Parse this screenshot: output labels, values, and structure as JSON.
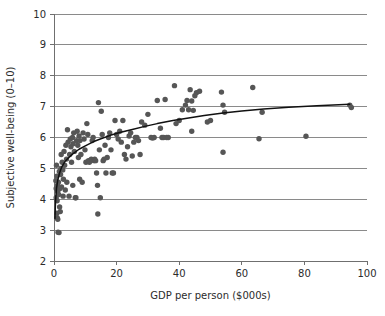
{
  "chart_data": {
    "type": "scatter",
    "title": "",
    "xlabel": "GDP per person ($000s)",
    "ylabel": "Subjective well-being (0–10)",
    "xlim": [
      0,
      100
    ],
    "ylim": [
      2,
      10
    ],
    "xticks": [
      0,
      20,
      40,
      60,
      80,
      100
    ],
    "xtick_labels": [
      "0",
      "20",
      "40",
      "60",
      "80",
      "100"
    ],
    "yticks": [
      2,
      3,
      4,
      5,
      6,
      7,
      8,
      9,
      10
    ],
    "ytick_labels": [
      "2",
      "3",
      "4",
      "5",
      "6",
      "7",
      "8",
      "9",
      "10"
    ],
    "grid": "horizontal",
    "legend": "none",
    "point_color": "#565656",
    "curve_color": "#111111",
    "gridline_color": "#8a8a8a",
    "background_color": "#ffffff",
    "series": [
      {
        "name": "Countries",
        "marker": "circle",
        "points": [
          [
            0.6,
            4.6
          ],
          [
            0.7,
            4.35
          ],
          [
            0.8,
            5.1
          ],
          [
            0.9,
            4.75
          ],
          [
            0.7,
            4.05
          ],
          [
            1.0,
            3.95
          ],
          [
            1.1,
            4.45
          ],
          [
            1.2,
            4.25
          ],
          [
            0.9,
            3.55
          ],
          [
            1.0,
            3.4
          ],
          [
            1.3,
            2.93
          ],
          [
            1.6,
            2.92
          ],
          [
            1.2,
            3.35
          ],
          [
            1.5,
            4.15
          ],
          [
            1.4,
            4.55
          ],
          [
            1.7,
            4.9
          ],
          [
            1.9,
            4.35
          ],
          [
            2.1,
            4.8
          ],
          [
            2.2,
            5.0
          ],
          [
            1.8,
            3.75
          ],
          [
            2.0,
            3.6
          ],
          [
            2.4,
            4.4
          ],
          [
            2.6,
            5.2
          ],
          [
            2.3,
            5.45
          ],
          [
            2.8,
            4.95
          ],
          [
            3.0,
            4.65
          ],
          [
            3.2,
            5.55
          ],
          [
            3.4,
            5.1
          ],
          [
            2.9,
            4.1
          ],
          [
            3.6,
            4.3
          ],
          [
            3.8,
            5.75
          ],
          [
            4.0,
            5.3
          ],
          [
            4.3,
            6.25
          ],
          [
            4.5,
            5.85
          ],
          [
            4.1,
            4.55
          ],
          [
            4.8,
            4.1
          ],
          [
            5.0,
            5.45
          ],
          [
            5.2,
            5.95
          ],
          [
            5.4,
            5.7
          ],
          [
            5.6,
            5.2
          ],
          [
            5.9,
            6.0
          ],
          [
            6.1,
            5.8
          ],
          [
            6.3,
            6.15
          ],
          [
            6.5,
            5.55
          ],
          [
            6.0,
            4.45
          ],
          [
            6.8,
            4.05
          ],
          [
            7.0,
            4.05
          ],
          [
            7.2,
            5.9
          ],
          [
            7.4,
            6.2
          ],
          [
            7.6,
            5.75
          ],
          [
            7.8,
            5.35
          ],
          [
            8.0,
            6.05
          ],
          [
            8.3,
            5.9
          ],
          [
            8.6,
            5.45
          ],
          [
            8.2,
            4.65
          ],
          [
            9.0,
            4.55
          ],
          [
            9.3,
            6.15
          ],
          [
            9.6,
            5.95
          ],
          [
            9.9,
            5.6
          ],
          [
            10.2,
            5.2
          ],
          [
            10.5,
            6.45
          ],
          [
            10.8,
            6.1
          ],
          [
            11.0,
            5.25
          ],
          [
            11.3,
            5.2
          ],
          [
            11.6,
            5.25
          ],
          [
            11.9,
            5.3
          ],
          [
            12.2,
            5.9
          ],
          [
            12.5,
            6.0
          ],
          [
            12.8,
            5.25
          ],
          [
            13.0,
            5.3
          ],
          [
            13.3,
            5.25
          ],
          [
            13.6,
            4.85
          ],
          [
            13.9,
            4.45
          ],
          [
            14.2,
            7.13
          ],
          [
            14.5,
            5.6
          ],
          [
            14.0,
            3.52
          ],
          [
            14.8,
            4.05
          ],
          [
            15.1,
            6.85
          ],
          [
            15.4,
            6.1
          ],
          [
            15.7,
            5.25
          ],
          [
            16.0,
            5.3
          ],
          [
            16.3,
            5.75
          ],
          [
            16.6,
            4.85
          ],
          [
            17.0,
            5.35
          ],
          [
            17.4,
            6.0
          ],
          [
            17.8,
            6.15
          ],
          [
            18.2,
            5.6
          ],
          [
            18.6,
            4.85
          ],
          [
            19.0,
            4.85
          ],
          [
            19.5,
            6.55
          ],
          [
            20.0,
            6.1
          ],
          [
            20.5,
            5.95
          ],
          [
            21.0,
            6.2
          ],
          [
            21.5,
            5.85
          ],
          [
            22.0,
            6.55
          ],
          [
            22.5,
            5.45
          ],
          [
            23.0,
            5.3
          ],
          [
            23.5,
            5.7
          ],
          [
            24.0,
            6.05
          ],
          [
            24.5,
            6.15
          ],
          [
            25.0,
            5.4
          ],
          [
            25.5,
            5.85
          ],
          [
            26.0,
            6.0
          ],
          [
            26.5,
            6.0
          ],
          [
            27.0,
            5.9
          ],
          [
            27.5,
            5.45
          ],
          [
            28.0,
            6.5
          ],
          [
            29.0,
            6.4
          ],
          [
            30.0,
            6.75
          ],
          [
            31.0,
            6.0
          ],
          [
            31.5,
            5.98
          ],
          [
            32.0,
            6.0
          ],
          [
            33.0,
            7.2
          ],
          [
            34.0,
            6.3
          ],
          [
            34.5,
            6.0
          ],
          [
            35.0,
            6.0
          ],
          [
            35.5,
            7.23
          ],
          [
            36.0,
            6.0
          ],
          [
            36.5,
            6.0
          ],
          [
            38.5,
            7.68
          ],
          [
            39.0,
            6.45
          ],
          [
            40.0,
            6.55
          ],
          [
            41.0,
            6.9
          ],
          [
            42.0,
            7.05
          ],
          [
            42.5,
            7.2
          ],
          [
            43.0,
            6.9
          ],
          [
            43.5,
            7.55
          ],
          [
            44.0,
            7.18
          ],
          [
            44.5,
            6.88
          ],
          [
            45.0,
            7.35
          ],
          [
            45.5,
            7.45
          ],
          [
            46.5,
            7.5
          ],
          [
            44.0,
            6.2
          ],
          [
            49.0,
            6.5
          ],
          [
            50.0,
            6.55
          ],
          [
            53.5,
            7.47
          ],
          [
            54.0,
            7.05
          ],
          [
            54.5,
            6.82
          ],
          [
            54.0,
            5.52
          ],
          [
            63.5,
            7.62
          ],
          [
            65.5,
            5.96
          ],
          [
            66.5,
            6.82
          ],
          [
            80.5,
            6.04
          ],
          [
            94.5,
            7.05
          ],
          [
            95.0,
            6.97
          ]
        ]
      }
    ],
    "fit_curve": {
      "name": "Logarithmic fit",
      "description": "Subjective well-being rises steeply at low GDP then flattens",
      "points": [
        [
          0.3,
          3.38
        ],
        [
          0.5,
          3.95
        ],
        [
          0.8,
          4.35
        ],
        [
          1.2,
          4.62
        ],
        [
          1.8,
          4.86
        ],
        [
          2.5,
          5.05
        ],
        [
          3.5,
          5.22
        ],
        [
          4.5,
          5.33
        ],
        [
          6.0,
          5.47
        ],
        [
          8.0,
          5.62
        ],
        [
          10.0,
          5.73
        ],
        [
          12.5,
          5.86
        ],
        [
          15.0,
          5.96
        ],
        [
          18.0,
          6.07
        ],
        [
          21.0,
          6.16
        ],
        [
          25.0,
          6.26
        ],
        [
          29.0,
          6.36
        ],
        [
          33.0,
          6.45
        ],
        [
          38.0,
          6.55
        ],
        [
          43.0,
          6.63
        ],
        [
          48.0,
          6.71
        ],
        [
          54.0,
          6.79
        ],
        [
          60.0,
          6.86
        ],
        [
          67.0,
          6.92
        ],
        [
          75.0,
          6.98
        ],
        [
          84.0,
          7.03
        ],
        [
          94.5,
          7.08
        ]
      ]
    }
  }
}
